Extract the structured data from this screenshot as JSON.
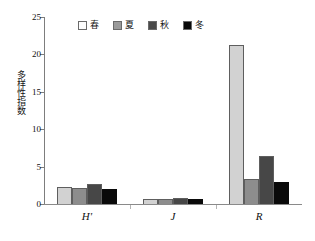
{
  "chart_data": {
    "type": "bar",
    "title": "",
    "subtitle": "",
    "xlabel": "",
    "ylabel": "多样性指数",
    "categories": [
      "H'",
      "J",
      "R"
    ],
    "series": [
      {
        "name": "春",
        "color": "#d2d2d2",
        "values": [
          2.3,
          0.7,
          21.3
        ]
      },
      {
        "name": "夏",
        "color": "#8d8d8d",
        "values": [
          2.2,
          0.7,
          3.3
        ]
      },
      {
        "name": "秋",
        "color": "#474747",
        "values": [
          2.7,
          0.75,
          6.4
        ]
      },
      {
        "name": "冬",
        "color": "#0a0a0a",
        "values": [
          2.0,
          0.7,
          2.9
        ]
      }
    ],
    "ylim": [
      0,
      25
    ],
    "yticks": [
      0,
      5,
      10,
      15,
      20,
      25
    ],
    "ytick_labels": [
      "0",
      "5",
      "10",
      "15",
      "20",
      "25"
    ],
    "grid": false,
    "legend_position": "top-center",
    "legend_entries": [
      "春",
      "夏",
      "秋",
      "冬"
    ]
  },
  "axis": {
    "y_title": "多样性指数",
    "tick_0": "0",
    "tick_5": "5",
    "tick_10": "10",
    "tick_15": "15",
    "tick_20": "20",
    "tick_25": "25"
  },
  "legend": {
    "spring": "春",
    "summer": "夏",
    "autumn": "秋",
    "winter": "冬"
  },
  "x_labels": {
    "group1": "H'",
    "group2": "J",
    "group3": "R"
  }
}
